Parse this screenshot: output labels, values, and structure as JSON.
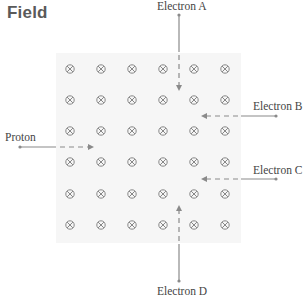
{
  "title": "Field",
  "field": {
    "symbol": "into-page-cross",
    "rows": 6,
    "cols": 6,
    "col_x": [
      70,
      101,
      132,
      163,
      194,
      225
    ],
    "row_y": [
      69,
      100,
      131,
      162,
      194,
      225
    ]
  },
  "particles": [
    {
      "id": "proton",
      "label": "Proton",
      "direction": "right"
    },
    {
      "id": "electron-a",
      "label": "Electron A",
      "direction": "down"
    },
    {
      "id": "electron-b",
      "label": "Electron B",
      "direction": "left"
    },
    {
      "id": "electron-c",
      "label": "Electron C",
      "direction": "left"
    },
    {
      "id": "electron-d",
      "label": "Electron D",
      "direction": "up"
    }
  ],
  "colors": {
    "title": "#5a5a5a",
    "field_bg": "#f6f6f6",
    "arrow": "#8a8a8a",
    "symbol": "#7a7a7a"
  }
}
